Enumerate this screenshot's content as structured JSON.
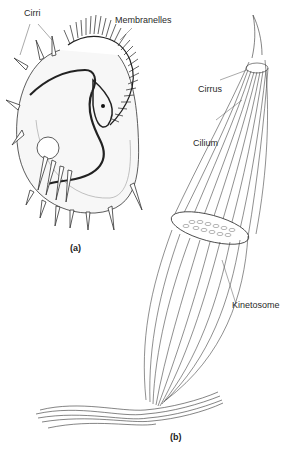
{
  "figure": {
    "panel_a": {
      "caption": "(a)",
      "labels": {
        "cirri": "Cirri",
        "membranelles": "Membranelles"
      }
    },
    "panel_b": {
      "caption": "(b)",
      "labels": {
        "cirrus": "Cirrus",
        "cilium": "Cilium",
        "kinetosome": "Kinetosome"
      }
    }
  }
}
